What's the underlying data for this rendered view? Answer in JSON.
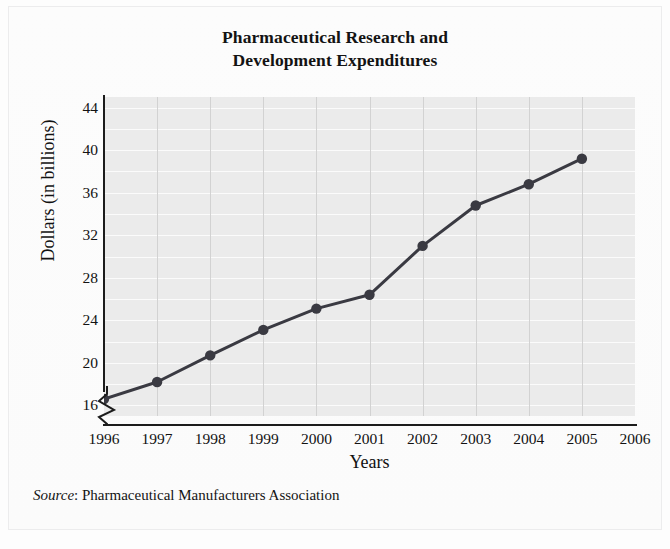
{
  "chart_data": {
    "type": "line",
    "title": "Pharmaceutical Research and Development Expenditures",
    "title_lines": [
      "Pharmaceutical Research and",
      "Development Expenditures"
    ],
    "xlabel": "Years",
    "ylabel": "Dollars (in billions)",
    "x": [
      1996,
      1997,
      1998,
      1999,
      2000,
      2001,
      2002,
      2003,
      2004,
      2005
    ],
    "values": [
      16.6,
      18.2,
      20.7,
      23.1,
      25.1,
      26.4,
      31.0,
      34.8,
      36.8,
      39.2
    ],
    "series": [
      {
        "name": "R&D Expenditures",
        "values": [
          16.6,
          18.2,
          20.7,
          23.1,
          25.1,
          26.4,
          31.0,
          34.8,
          36.8,
          39.2
        ]
      }
    ],
    "x_tick_labels": [
      "1996",
      "1997",
      "1998",
      "1999",
      "2000",
      "2001",
      "2002",
      "2003",
      "2004",
      "2005",
      "2006"
    ],
    "x_ticks": [
      1996,
      1997,
      1998,
      1999,
      2000,
      2001,
      2002,
      2003,
      2004,
      2005,
      2006
    ],
    "y_tick_labels": [
      "16",
      "20",
      "24",
      "28",
      "32",
      "36",
      "40",
      "44"
    ],
    "y_ticks": [
      16,
      20,
      24,
      28,
      32,
      36,
      40,
      44
    ],
    "ylim": [
      15,
      45
    ],
    "xlim": [
      1996,
      2006
    ],
    "y_minor_step": 2,
    "grid": true,
    "grid_horizontal": true,
    "grid_vertical": true,
    "axis_break": true,
    "axis_break_axis": "y",
    "legend": false,
    "legend_position": "none",
    "marker": "circle",
    "line_color": "#3a3a42",
    "marker_color": "#3a3a42",
    "plot_background": "#ebebeb",
    "gridline_color": "#fbfbfb",
    "vertical_gridline_color": "#d2d2d2",
    "axis_color": "#1c1c1c"
  },
  "source": {
    "label": "Source",
    "separator": ": ",
    "text": "Pharmaceutical Manufacturers Association"
  }
}
